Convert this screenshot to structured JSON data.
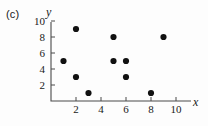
{
  "panel": {
    "label": "(c)"
  },
  "axes": {
    "x_title": "x",
    "y_title": "y",
    "x_ticks": [
      "2",
      "4",
      "6",
      "8",
      "10"
    ],
    "y_ticks": [
      "2",
      "4",
      "6",
      "8",
      "10"
    ]
  },
  "chart_data": {
    "type": "scatter",
    "title": "(c)",
    "xlabel": "x",
    "ylabel": "y",
    "xlim": [
      0,
      11.5
    ],
    "ylim": [
      0,
      11
    ],
    "grid": false,
    "legend": false,
    "xticks": [
      2,
      4,
      6,
      8,
      10
    ],
    "yticks": [
      2,
      4,
      6,
      8,
      10
    ],
    "x": [
      1,
      2,
      2,
      3,
      5,
      5,
      6,
      6,
      8,
      9
    ],
    "y": [
      5,
      9,
      3,
      1,
      8,
      5,
      5,
      3,
      1,
      8
    ],
    "points": [
      {
        "x": 1,
        "y": 5
      },
      {
        "x": 2,
        "y": 9
      },
      {
        "x": 2,
        "y": 3
      },
      {
        "x": 3,
        "y": 1
      },
      {
        "x": 5,
        "y": 8
      },
      {
        "x": 5,
        "y": 5
      },
      {
        "x": 6,
        "y": 5
      },
      {
        "x": 6,
        "y": 3
      },
      {
        "x": 8,
        "y": 1
      },
      {
        "x": 9,
        "y": 8
      }
    ],
    "marker": "filled-circle",
    "marker_color": "#111111"
  }
}
